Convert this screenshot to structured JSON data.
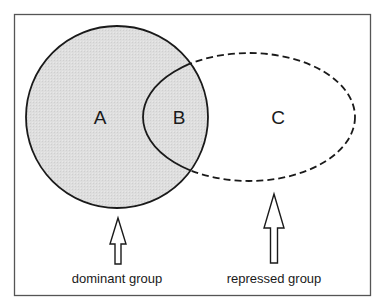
{
  "diagram": {
    "type": "venn",
    "regions": {
      "a": "A",
      "b": "B",
      "c": "C"
    },
    "captions": {
      "dominant": "dominant group",
      "repressed": "repressed group"
    },
    "colors": {
      "frame": "#555555",
      "shade": "#dcdcdc",
      "stroke": "#1a1a1a",
      "background": "#ffffff"
    }
  }
}
